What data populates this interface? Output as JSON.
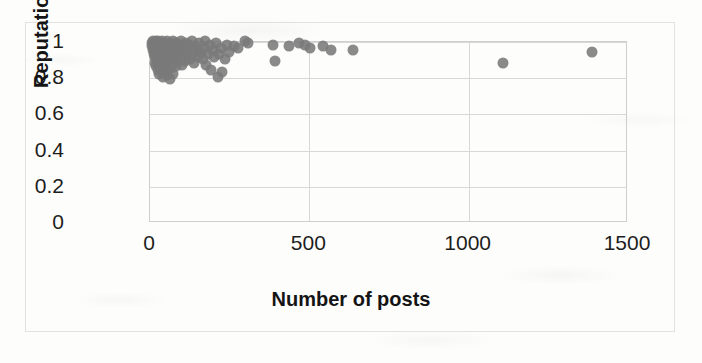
{
  "chart_data": {
    "type": "scatter",
    "title": "",
    "xlabel": "Number of posts",
    "ylabel": "Reputation",
    "xlim": [
      0,
      1500
    ],
    "ylim": [
      0,
      1
    ],
    "xticks": [
      0,
      500,
      1000,
      1500
    ],
    "yticks": [
      0,
      0.2,
      0.4,
      0.6,
      0.8,
      1
    ],
    "xtick_labels": [
      "0",
      "500",
      "1000",
      "1500"
    ],
    "ytick_labels": [
      "0",
      "0.2",
      "0.4",
      "0.6",
      "0.8",
      "1"
    ],
    "grid": "horizontal-and-vertical",
    "legend": "none",
    "marker_color": "#7a7a7a",
    "marker_size_px": 11,
    "points": [
      [
        8,
        0.99
      ],
      [
        10,
        0.97
      ],
      [
        12,
        1.0
      ],
      [
        14,
        0.95
      ],
      [
        15,
        0.93
      ],
      [
        16,
        0.99
      ],
      [
        18,
        0.91
      ],
      [
        19,
        0.97
      ],
      [
        20,
        0.88
      ],
      [
        21,
        1.0
      ],
      [
        22,
        0.94
      ],
      [
        23,
        0.86
      ],
      [
        24,
        0.98
      ],
      [
        25,
        0.92
      ],
      [
        26,
        0.9
      ],
      [
        27,
        0.96
      ],
      [
        28,
        0.84
      ],
      [
        29,
        1.0
      ],
      [
        30,
        0.88
      ],
      [
        31,
        0.95
      ],
      [
        32,
        0.82
      ],
      [
        33,
        0.99
      ],
      [
        34,
        0.93
      ],
      [
        35,
        0.87
      ],
      [
        36,
        0.97
      ],
      [
        38,
        0.91
      ],
      [
        39,
        0.85
      ],
      [
        40,
        1.0
      ],
      [
        41,
        0.94
      ],
      [
        42,
        0.89
      ],
      [
        43,
        0.8
      ],
      [
        44,
        0.98
      ],
      [
        45,
        0.92
      ],
      [
        46,
        0.96
      ],
      [
        47,
        0.86
      ],
      [
        48,
        0.83
      ],
      [
        50,
        0.99
      ],
      [
        51,
        0.93
      ],
      [
        52,
        0.9
      ],
      [
        53,
        0.97
      ],
      [
        54,
        0.88
      ],
      [
        55,
        0.81
      ],
      [
        56,
        1.0
      ],
      [
        58,
        0.95
      ],
      [
        59,
        0.84
      ],
      [
        60,
        0.92
      ],
      [
        61,
        0.98
      ],
      [
        62,
        0.87
      ],
      [
        64,
        0.94
      ],
      [
        65,
        0.79
      ],
      [
        66,
        0.99
      ],
      [
        68,
        0.91
      ],
      [
        69,
        0.85
      ],
      [
        70,
        0.96
      ],
      [
        72,
        0.89
      ],
      [
        74,
        1.0
      ],
      [
        75,
        0.93
      ],
      [
        76,
        0.82
      ],
      [
        78,
        0.97
      ],
      [
        80,
        0.88
      ],
      [
        82,
        0.94
      ],
      [
        84,
        0.99
      ],
      [
        85,
        0.86
      ],
      [
        88,
        0.92
      ],
      [
        90,
        0.96
      ],
      [
        92,
        0.9
      ],
      [
        95,
        0.98
      ],
      [
        98,
        0.93
      ],
      [
        100,
        1.0
      ],
      [
        102,
        0.87
      ],
      [
        105,
        0.95
      ],
      [
        108,
        0.91
      ],
      [
        110,
        0.97
      ],
      [
        112,
        0.89
      ],
      [
        115,
        0.99
      ],
      [
        118,
        0.94
      ],
      [
        120,
        0.92
      ],
      [
        124,
        0.98
      ],
      [
        128,
        0.9
      ],
      [
        130,
        0.96
      ],
      [
        134,
        1.0
      ],
      [
        138,
        0.93
      ],
      [
        142,
        0.88
      ],
      [
        145,
        0.97
      ],
      [
        150,
        0.95
      ],
      [
        155,
        0.91
      ],
      [
        158,
        0.99
      ],
      [
        162,
        0.94
      ],
      [
        168,
        0.9
      ],
      [
        172,
        0.96
      ],
      [
        176,
        1.0
      ],
      [
        180,
        0.87
      ],
      [
        185,
        0.93
      ],
      [
        190,
        0.98
      ],
      [
        195,
        0.84
      ],
      [
        200,
        0.95
      ],
      [
        205,
        0.91
      ],
      [
        210,
        0.99
      ],
      [
        215,
        0.8
      ],
      [
        220,
        0.93
      ],
      [
        225,
        0.96
      ],
      [
        230,
        0.83
      ],
      [
        238,
        0.9
      ],
      [
        245,
        0.98
      ],
      [
        252,
        0.94
      ],
      [
        268,
        0.97
      ],
      [
        280,
        0.96
      ],
      [
        300,
        1.0
      ],
      [
        310,
        0.99
      ],
      [
        390,
        0.98
      ],
      [
        395,
        0.89
      ],
      [
        440,
        0.97
      ],
      [
        470,
        0.99
      ],
      [
        490,
        0.98
      ],
      [
        505,
        0.96
      ],
      [
        545,
        0.97
      ],
      [
        570,
        0.95
      ],
      [
        640,
        0.95
      ],
      [
        1110,
        0.88
      ],
      [
        1390,
        0.94
      ]
    ]
  }
}
